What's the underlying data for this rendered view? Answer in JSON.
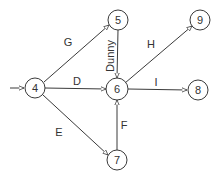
{
  "diagram": {
    "type": "activity-on-arrow network",
    "nodes": [
      {
        "id": "4",
        "label": "4",
        "x": 35,
        "y": 88
      },
      {
        "id": "5",
        "label": "5",
        "x": 118,
        "y": 20
      },
      {
        "id": "9",
        "label": "9",
        "x": 200,
        "y": 20
      },
      {
        "id": "6",
        "label": "6",
        "x": 117,
        "y": 89
      },
      {
        "id": "8",
        "label": "8",
        "x": 198,
        "y": 90
      },
      {
        "id": "7",
        "label": "7",
        "x": 117,
        "y": 160
      }
    ],
    "edges": [
      {
        "from": "start",
        "to": "4",
        "label": ""
      },
      {
        "from": "4",
        "to": "5",
        "label": "G"
      },
      {
        "from": "4",
        "to": "6",
        "label": "D"
      },
      {
        "from": "4",
        "to": "7",
        "label": "E"
      },
      {
        "from": "5",
        "to": "6",
        "label": "Dunny"
      },
      {
        "from": "6",
        "to": "9",
        "label": "H"
      },
      {
        "from": "6",
        "to": "8",
        "label": "I"
      },
      {
        "from": "7",
        "to": "6",
        "label": "F"
      }
    ],
    "colors": {
      "line": "#3a3a3a",
      "text": "#333333",
      "background": "#ffffff"
    }
  }
}
